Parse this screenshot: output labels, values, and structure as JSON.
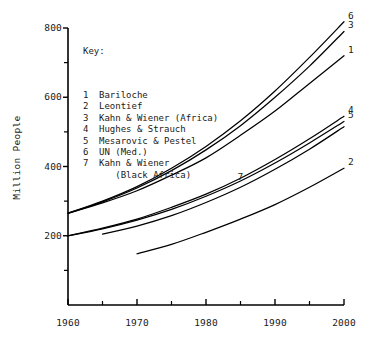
{
  "figure": {
    "y_axis_title": "Million People",
    "key_title": "Key:"
  },
  "key": {
    "items": [
      {
        "num": "1",
        "name": "Bariloche",
        "cont": ""
      },
      {
        "num": "2",
        "name": "Leontief",
        "cont": ""
      },
      {
        "num": "3",
        "name": "Kahn & Wiener (Africa)",
        "cont": ""
      },
      {
        "num": "4",
        "name": "Hughes & Strauch",
        "cont": ""
      },
      {
        "num": "5",
        "name": "Mesarovic & Pestel",
        "cont": ""
      },
      {
        "num": "6",
        "name": "UN (Med.)",
        "cont": ""
      },
      {
        "num": "7",
        "name": "Kahn & Wiener",
        "cont": "   (Black Africa)"
      }
    ]
  },
  "axes": {
    "y_ticks_major": [
      "800",
      "600",
      "400",
      "200"
    ],
    "y_ticks_major_values": [
      800,
      600,
      400,
      200
    ],
    "y_ticks_minor_values": [
      700,
      500,
      300,
      100
    ],
    "x_ticks_major": [
      "1960",
      "1970",
      "1980",
      "1990",
      "2000"
    ],
    "x_ticks_major_values": [
      1960,
      1970,
      1980,
      1990,
      2000
    ],
    "x_ticks_minor_values": [
      1965,
      1975,
      1985,
      1995
    ]
  },
  "chart_data": {
    "type": "line",
    "title": "",
    "xlabel": "",
    "ylabel": "Million People",
    "xlim": [
      1960,
      2000
    ],
    "ylim": [
      0,
      800
    ],
    "grid": false,
    "legend_position": "inside-top-left",
    "legend_title": "Key:",
    "x_tick_labels": [
      "1960",
      "1970",
      "1980",
      "1990",
      "2000"
    ],
    "y_tick_labels": [
      "200",
      "400",
      "600",
      "800"
    ],
    "series": [
      {
        "name": "Bariloche",
        "label": "1",
        "x": [
          1960,
          1965,
          1970,
          1975,
          1980,
          1985,
          1990,
          1995,
          2000
        ],
        "values": [
          265,
          295,
          330,
          375,
          425,
          490,
          560,
          640,
          720
        ]
      },
      {
        "name": "Leontief",
        "label": "2",
        "x": [
          1970,
          1975,
          1980,
          1985,
          1990,
          1995,
          2000
        ],
        "values": [
          148,
          175,
          210,
          248,
          290,
          340,
          395
        ]
      },
      {
        "name": "Kahn & Wiener (Africa)",
        "label": "3",
        "x": [
          1960,
          1965,
          1970,
          1975,
          1980,
          1985,
          1990,
          1995,
          2000
        ],
        "values": [
          265,
          298,
          338,
          388,
          448,
          518,
          600,
          690,
          790
        ]
      },
      {
        "name": "Hughes & Strauch",
        "label": "4",
        "x": [
          1960,
          1965,
          1970,
          1975,
          1980,
          1985,
          1990,
          1995,
          2000
        ],
        "values": [
          200,
          222,
          248,
          282,
          320,
          366,
          420,
          480,
          545
        ]
      },
      {
        "name": "Mesarovic & Pestel",
        "label": "5",
        "x": [
          1960,
          1965,
          1970,
          1975,
          1980,
          1985,
          1990,
          1995,
          2000
        ],
        "values": [
          200,
          220,
          245,
          276,
          314,
          358,
          410,
          468,
          530
        ]
      },
      {
        "name": "UN (Med.)",
        "label": "6",
        "x": [
          1960,
          1965,
          1970,
          1975,
          1980,
          1985,
          1990,
          1995,
          2000
        ],
        "values": [
          265,
          300,
          342,
          395,
          458,
          532,
          618,
          715,
          818
        ]
      },
      {
        "name": "Kahn & Wiener (Black Africa)",
        "label": "7",
        "x": [
          1965,
          1970,
          1975,
          1980,
          1985,
          1990,
          1995,
          2000
        ],
        "values": [
          205,
          228,
          258,
          296,
          340,
          392,
          450,
          515
        ]
      }
    ],
    "inline_labels": [
      {
        "text": "6",
        "x": 2000,
        "y": 818
      },
      {
        "text": "3",
        "x": 2000,
        "y": 790
      },
      {
        "text": "1",
        "x": 2000,
        "y": 720
      },
      {
        "text": "4",
        "x": 2000,
        "y": 545
      },
      {
        "text": "5",
        "x": 2000,
        "y": 530
      },
      {
        "text": "2",
        "x": 2000,
        "y": 395
      },
      {
        "text": "7",
        "x": 1985,
        "y": 340
      }
    ]
  }
}
